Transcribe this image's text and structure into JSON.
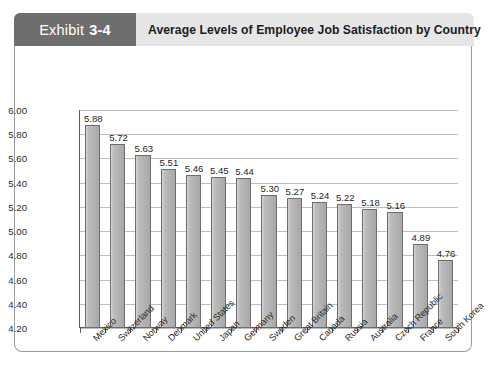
{
  "header": {
    "tab_word": "Exhibit",
    "tab_number": "3-4",
    "title": "Average Levels of Employee Job Satisfaction by Country"
  },
  "colors": {
    "tab_background": "#6e6e6e",
    "strip_background": "#e6e6e6",
    "bar_fill": "#b5b5b5",
    "bar_border": "#6d6d6d",
    "gridline": "#bdbdbd",
    "axis": "#5a5a5a",
    "frame_border": "#9a9a9a"
  },
  "chart_data": {
    "type": "bar",
    "title": "Average Levels of Employee Job Satisfaction by Country",
    "xlabel": "",
    "ylabel": "",
    "ylim": [
      4.2,
      6.0
    ],
    "ytick_step": 0.2,
    "ytick_labels": [
      "6.00",
      "5.80",
      "5.60",
      "5.40",
      "5.20",
      "5.00",
      "4.80",
      "4.60",
      "4.40",
      "4.20"
    ],
    "ytick_values": [
      6.0,
      5.8,
      5.6,
      5.4,
      5.2,
      5.0,
      4.8,
      4.6,
      4.4,
      4.2
    ],
    "grid": true,
    "legend": false,
    "categories": [
      "Mexico",
      "Switzerland",
      "Norway",
      "Denmark",
      "United States",
      "Japan",
      "Germany",
      "Sweden",
      "Great Britain",
      "Canada",
      "Russia",
      "Australia",
      "Czech Republic",
      "France",
      "South Korea"
    ],
    "values": [
      5.88,
      5.72,
      5.63,
      5.51,
      5.46,
      5.45,
      5.44,
      5.3,
      5.27,
      5.24,
      5.22,
      5.18,
      5.16,
      4.89,
      4.76
    ],
    "data_labels": [
      "5.88",
      "5.72",
      "5.63",
      "5.51",
      "5.46",
      "5.45",
      "5.44",
      "5.30",
      "5.27",
      "5.24",
      "5.22",
      "5.18",
      "5.16",
      "4.89",
      "4.76"
    ]
  }
}
